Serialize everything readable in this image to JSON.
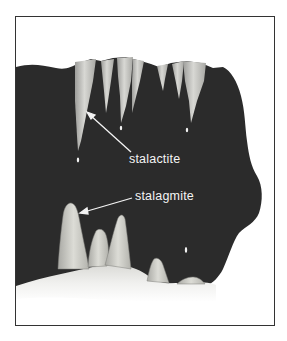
{
  "diagram": {
    "colors": {
      "cave_interior": "#2b2b2b",
      "rock_formation": "#c9c9c6",
      "floor": "#ececea",
      "frame_border": "#333333",
      "label_text": "#f4f4f4",
      "background": "#ffffff"
    },
    "labels": [
      {
        "id": "stalactite",
        "text": "stalactite",
        "x": 128,
        "y": 152
      },
      {
        "id": "stalagmite",
        "text": "stalagmite",
        "x": 134,
        "y": 189
      }
    ],
    "arrows": [
      {
        "for": "stalactite",
        "from": [
          130,
          151
        ],
        "to": [
          86,
          111
        ]
      },
      {
        "for": "stalagmite",
        "from": [
          131,
          197
        ],
        "to": [
          79,
          212
        ]
      }
    ],
    "stalactite_count": 7,
    "stalagmite_count": 5,
    "water_drops": 4
  }
}
